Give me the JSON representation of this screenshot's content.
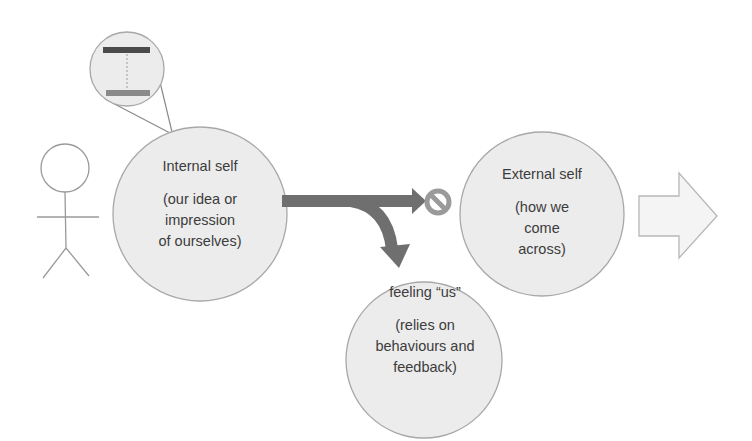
{
  "diagram": {
    "type": "concept-flow",
    "colors": {
      "background": "#ffffff",
      "circle_fill": "#ececec",
      "circle_stroke": "#a8a8a8",
      "arrow_fill": "#6f6f6f",
      "no_symbol": "#9a9a9a",
      "magnifier_dark_bar": "#4a4a4a",
      "magnifier_light_bar": "#8a8a8a",
      "block_arrow_fill": "#f4f4f4",
      "block_arrow_stroke": "#b8b8b8",
      "stick_figure": "#9a9a9a"
    },
    "nodes": {
      "internal_self": {
        "title": "Internal self",
        "description_lines": [
          "(our idea or",
          "impression",
          "of ourselves)"
        ]
      },
      "external_self": {
        "title": "External self",
        "description_lines": [
          "(how we",
          "come",
          "across)"
        ]
      },
      "feeling_us": {
        "title": "feeling “us”",
        "description_lines": [
          "(relies on",
          "behaviours and",
          "feedback)"
        ]
      }
    },
    "icons": {
      "person": "stick-figure-icon",
      "magnifier": "magnifier-icon",
      "blocked": "no-symbol-icon",
      "next": "block-arrow-right-icon"
    },
    "edges": [
      {
        "from": "internal_self",
        "to": "external_self",
        "status": "blocked"
      },
      {
        "from": "internal_self",
        "to": "feeling_us",
        "status": "redirected"
      }
    ]
  }
}
